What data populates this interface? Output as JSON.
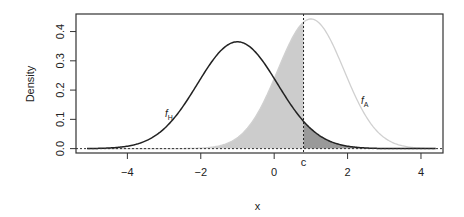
{
  "chart_data": {
    "type": "line",
    "title": "",
    "xlabel": "x",
    "ylabel": "Density",
    "xlim": [
      -5.4,
      4.6
    ],
    "ylim": [
      -0.015,
      0.46
    ],
    "x_ticks": [
      -4,
      -2,
      0,
      2,
      4
    ],
    "x_tick_labels": [
      "−4",
      "−2",
      "0",
      "2",
      "4"
    ],
    "y_ticks": [
      0.0,
      0.1,
      0.2,
      0.3,
      0.4
    ],
    "y_tick_labels": [
      "0.0",
      "0.1",
      "0.2",
      "0.3",
      "0.4"
    ],
    "grid": false,
    "legend": null,
    "series": [
      {
        "name": "f_H",
        "label": "f",
        "subscript": "H",
        "distribution": "normal",
        "mean": -1,
        "sd": 1.09,
        "peak": 0.365,
        "color": "#222222",
        "style": "solid"
      },
      {
        "name": "f_A",
        "label": "f",
        "subscript": "A",
        "distribution": "normal",
        "mean": 1,
        "sd": 0.9,
        "peak": 0.443,
        "color": "#d0d0d0",
        "style": "solid"
      }
    ],
    "threshold": {
      "label": "c",
      "x": 0.8,
      "style": "dashed"
    },
    "baseline": {
      "y": 0.0,
      "style": "dotted"
    },
    "shaded_regions": [
      {
        "name": "f_A below c",
        "curve": "f_A",
        "from": -5.4,
        "to": 0.8,
        "color": "#cccccc"
      },
      {
        "name": "f_H above c",
        "curve": "f_H",
        "from": 0.8,
        "to": 4.6,
        "color": "#999999"
      }
    ]
  },
  "labels": {
    "xlabel": "x",
    "ylabel": "Density",
    "threshold": "c",
    "fH_main": "f",
    "fH_sub": "H",
    "fA_main": "f",
    "fA_sub": "A"
  }
}
